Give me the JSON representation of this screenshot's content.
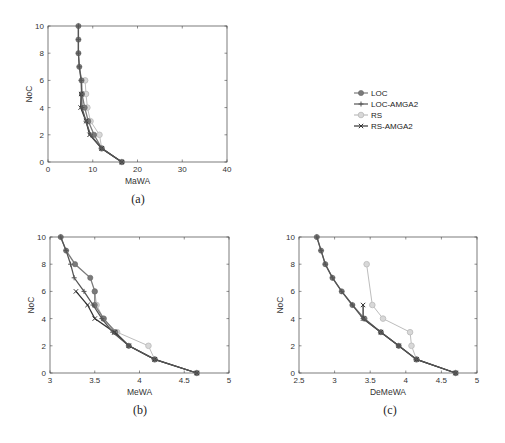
{
  "legend": {
    "entries": [
      {
        "name": "LOC",
        "color": "#7a7a7a",
        "marker": "o"
      },
      {
        "name": "LOC-AMGA2",
        "color": "#555555",
        "marker": "+"
      },
      {
        "name": "RS",
        "color": "#bdbdbd",
        "marker": "diamond"
      },
      {
        "name": "RS-AMGA2",
        "color": "#333333",
        "marker": "x"
      }
    ]
  },
  "chart_data": [
    {
      "type": "line",
      "caption": "(a)",
      "xlabel": "MaWA",
      "ylabel": "NoC",
      "xlim": [
        0,
        40
      ],
      "ylim": [
        0,
        10
      ],
      "xticks": [
        0,
        10,
        20,
        30,
        40
      ],
      "yticks": [
        0,
        2,
        4,
        6,
        8,
        10
      ],
      "grid": false,
      "series": [
        {
          "name": "LOC",
          "points": [
            [
              6.8,
              10
            ],
            [
              6.8,
              9
            ],
            [
              6.8,
              8
            ],
            [
              7,
              7
            ],
            [
              7.5,
              6
            ],
            [
              7.6,
              5
            ],
            [
              8.2,
              4
            ],
            [
              9,
              3
            ],
            [
              10.3,
              2
            ],
            [
              12,
              1
            ],
            [
              16.5,
              0
            ]
          ]
        },
        {
          "name": "LOC-AMGA2",
          "points": [
            [
              6.8,
              10
            ],
            [
              6.8,
              9
            ],
            [
              6.8,
              8
            ],
            [
              7,
              7
            ],
            [
              7.4,
              6
            ],
            [
              7.5,
              5
            ],
            [
              7.6,
              4
            ],
            [
              8.5,
              3
            ],
            [
              9.5,
              2
            ],
            [
              12,
              1
            ],
            [
              16.5,
              0
            ]
          ]
        },
        {
          "name": "RS",
          "points": [
            [
              8.3,
              6
            ],
            [
              8.5,
              5
            ],
            [
              8.8,
              4
            ],
            [
              9.5,
              3
            ],
            [
              11.5,
              2
            ],
            [
              12,
              1
            ],
            [
              16.5,
              0
            ]
          ]
        },
        {
          "name": "RS-AMGA2",
          "points": [
            [
              7.4,
              5
            ],
            [
              7.3,
              4
            ],
            [
              8.5,
              3
            ],
            [
              9.3,
              2
            ],
            [
              12,
              1
            ],
            [
              16.5,
              0
            ]
          ]
        }
      ]
    },
    {
      "type": "line",
      "caption": "(b)",
      "xlabel": "MeWA",
      "ylabel": "NoC",
      "xlim": [
        3,
        5
      ],
      "ylim": [
        0,
        10
      ],
      "xticks": [
        3,
        3.5,
        4,
        4.5,
        5
      ],
      "yticks": [
        0,
        2,
        4,
        6,
        8,
        10
      ],
      "grid": false,
      "series": [
        {
          "name": "LOC",
          "points": [
            [
              3.12,
              10
            ],
            [
              3.18,
              9
            ],
            [
              3.28,
              8
            ],
            [
              3.45,
              7
            ],
            [
              3.5,
              6
            ],
            [
              3.5,
              5
            ],
            [
              3.6,
              4
            ],
            [
              3.73,
              3
            ],
            [
              3.88,
              2
            ],
            [
              4.17,
              1
            ],
            [
              4.64,
              0
            ]
          ]
        },
        {
          "name": "LOC-AMGA2",
          "points": [
            [
              3.12,
              10
            ],
            [
              3.18,
              9
            ],
            [
              3.23,
              8
            ],
            [
              3.27,
              7
            ],
            [
              3.38,
              6
            ],
            [
              3.48,
              5
            ],
            [
              3.58,
              4
            ],
            [
              3.7,
              3
            ],
            [
              3.88,
              2
            ],
            [
              4.17,
              1
            ],
            [
              4.64,
              0
            ]
          ]
        },
        {
          "name": "RS",
          "points": [
            [
              3.5,
              6
            ],
            [
              3.52,
              5
            ],
            [
              3.6,
              4
            ],
            [
              3.75,
              3
            ],
            [
              4.1,
              2
            ],
            [
              4.17,
              1
            ],
            [
              4.64,
              0
            ]
          ]
        },
        {
          "name": "RS-AMGA2",
          "points": [
            [
              3.29,
              6
            ],
            [
              3.42,
              5
            ],
            [
              3.5,
              4
            ],
            [
              3.72,
              3
            ],
            [
              3.88,
              2
            ],
            [
              4.17,
              1
            ],
            [
              4.64,
              0
            ]
          ]
        }
      ]
    },
    {
      "type": "line",
      "caption": "(c)",
      "xlabel": "DeMeWA",
      "ylabel": "NoC",
      "xlim": [
        2.5,
        5
      ],
      "ylim": [
        0,
        10
      ],
      "xticks": [
        2.5,
        3,
        3.5,
        4,
        4.5,
        5
      ],
      "yticks": [
        0,
        2,
        4,
        6,
        8,
        10
      ],
      "grid": false,
      "series": [
        {
          "name": "LOC",
          "points": [
            [
              2.75,
              10
            ],
            [
              2.81,
              9
            ],
            [
              2.87,
              8
            ],
            [
              2.97,
              7
            ],
            [
              3.1,
              6
            ],
            [
              3.25,
              5
            ],
            [
              3.42,
              4
            ],
            [
              3.65,
              3
            ],
            [
              3.9,
              2
            ],
            [
              4.15,
              1
            ],
            [
              4.7,
              0
            ]
          ]
        },
        {
          "name": "LOC-AMGA2",
          "points": [
            [
              2.75,
              10
            ],
            [
              2.81,
              9
            ],
            [
              2.87,
              8
            ],
            [
              2.97,
              7
            ],
            [
              3.1,
              6
            ],
            [
              3.25,
              5
            ],
            [
              3.4,
              4
            ],
            [
              3.65,
              3
            ],
            [
              3.9,
              2
            ],
            [
              4.15,
              1
            ],
            [
              4.7,
              0
            ]
          ]
        },
        {
          "name": "RS",
          "points": [
            [
              3.45,
              8
            ],
            [
              3.53,
              5
            ],
            [
              3.68,
              4
            ],
            [
              4.06,
              3
            ],
            [
              4.08,
              2
            ],
            [
              4.15,
              1
            ],
            [
              4.7,
              0
            ]
          ]
        },
        {
          "name": "RS-AMGA2",
          "points": [
            [
              3.4,
              5
            ],
            [
              3.4,
              4
            ],
            [
              3.65,
              3
            ],
            [
              3.9,
              2
            ],
            [
              4.15,
              1
            ],
            [
              4.7,
              0
            ]
          ]
        }
      ]
    }
  ]
}
